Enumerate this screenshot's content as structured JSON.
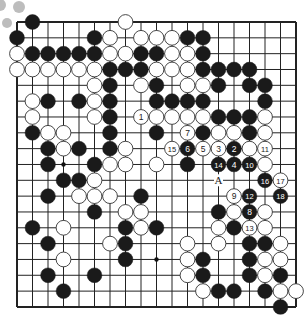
{
  "board": {
    "size": 19,
    "origin_x": 17,
    "origin_y": 22,
    "step_x": 15.5,
    "step_y": 15.83,
    "stone_radius": 7.4,
    "colors": {
      "line": "#222222",
      "black": "#1a1a1a",
      "white": "#ffffff",
      "stone_edge": "#333333",
      "star": "#111111",
      "decor": "#bdbdbd"
    },
    "star_points": [
      [
        3,
        9
      ],
      [
        9,
        15
      ]
    ],
    "label_A": {
      "text": "A",
      "col": 13,
      "row": 10
    },
    "stones": [
      {
        "c": "B",
        "x": 1,
        "y": 0
      },
      {
        "c": "W",
        "x": 7,
        "y": 0
      },
      {
        "c": "B",
        "x": 0,
        "y": 1
      },
      {
        "c": "B",
        "x": 5,
        "y": 1
      },
      {
        "c": "W",
        "x": 6,
        "y": 1
      },
      {
        "c": "W",
        "x": 8,
        "y": 1
      },
      {
        "c": "W",
        "x": 9,
        "y": 1
      },
      {
        "c": "W",
        "x": 10,
        "y": 1
      },
      {
        "c": "B",
        "x": 11,
        "y": 1
      },
      {
        "c": "B",
        "x": 12,
        "y": 1
      },
      {
        "c": "W",
        "x": 0,
        "y": 2
      },
      {
        "c": "B",
        "x": 1,
        "y": 2
      },
      {
        "c": "B",
        "x": 2,
        "y": 2
      },
      {
        "c": "B",
        "x": 3,
        "y": 2
      },
      {
        "c": "B",
        "x": 4,
        "y": 2
      },
      {
        "c": "B",
        "x": 5,
        "y": 2
      },
      {
        "c": "W",
        "x": 6,
        "y": 2
      },
      {
        "c": "W",
        "x": 7,
        "y": 2
      },
      {
        "c": "B",
        "x": 8,
        "y": 2
      },
      {
        "c": "B",
        "x": 9,
        "y": 2
      },
      {
        "c": "W",
        "x": 10,
        "y": 2
      },
      {
        "c": "W",
        "x": 11,
        "y": 2
      },
      {
        "c": "B",
        "x": 12,
        "y": 2
      },
      {
        "c": "W",
        "x": 0,
        "y": 3
      },
      {
        "c": "W",
        "x": 1,
        "y": 3
      },
      {
        "c": "W",
        "x": 2,
        "y": 3
      },
      {
        "c": "W",
        "x": 3,
        "y": 3
      },
      {
        "c": "W",
        "x": 4,
        "y": 3
      },
      {
        "c": "W",
        "x": 5,
        "y": 3
      },
      {
        "c": "B",
        "x": 6,
        "y": 3
      },
      {
        "c": "B",
        "x": 7,
        "y": 3
      },
      {
        "c": "B",
        "x": 8,
        "y": 3
      },
      {
        "c": "W",
        "x": 9,
        "y": 3
      },
      {
        "c": "W",
        "x": 10,
        "y": 3
      },
      {
        "c": "W",
        "x": 11,
        "y": 3
      },
      {
        "c": "B",
        "x": 12,
        "y": 3
      },
      {
        "c": "B",
        "x": 13,
        "y": 3
      },
      {
        "c": "B",
        "x": 14,
        "y": 3
      },
      {
        "c": "B",
        "x": 15,
        "y": 3
      },
      {
        "c": "W",
        "x": 5,
        "y": 4
      },
      {
        "c": "B",
        "x": 6,
        "y": 4
      },
      {
        "c": "W",
        "x": 8,
        "y": 4
      },
      {
        "c": "B",
        "x": 9,
        "y": 4
      },
      {
        "c": "W",
        "x": 11,
        "y": 4
      },
      {
        "c": "W",
        "x": 12,
        "y": 4
      },
      {
        "c": "B",
        "x": 13,
        "y": 4
      },
      {
        "c": "B",
        "x": 15,
        "y": 4
      },
      {
        "c": "B",
        "x": 16,
        "y": 4
      },
      {
        "c": "W",
        "x": 1,
        "y": 5
      },
      {
        "c": "B",
        "x": 2,
        "y": 5
      },
      {
        "c": "B",
        "x": 4,
        "y": 5
      },
      {
        "c": "W",
        "x": 5,
        "y": 5
      },
      {
        "c": "B",
        "x": 6,
        "y": 5
      },
      {
        "c": "B",
        "x": 9,
        "y": 5
      },
      {
        "c": "B",
        "x": 10,
        "y": 5
      },
      {
        "c": "B",
        "x": 11,
        "y": 5
      },
      {
        "c": "B",
        "x": 12,
        "y": 5
      },
      {
        "c": "B",
        "x": 16,
        "y": 5
      },
      {
        "c": "W",
        "x": 1,
        "y": 6
      },
      {
        "c": "W",
        "x": 5,
        "y": 6
      },
      {
        "c": "B",
        "x": 6,
        "y": 6
      },
      {
        "c": "W",
        "x": 8,
        "y": 6,
        "n": "1"
      },
      {
        "c": "W",
        "x": 9,
        "y": 6
      },
      {
        "c": "W",
        "x": 10,
        "y": 6
      },
      {
        "c": "W",
        "x": 11,
        "y": 6
      },
      {
        "c": "W",
        "x": 12,
        "y": 6
      },
      {
        "c": "B",
        "x": 13,
        "y": 6
      },
      {
        "c": "B",
        "x": 14,
        "y": 6
      },
      {
        "c": "B",
        "x": 15,
        "y": 6
      },
      {
        "c": "W",
        "x": 16,
        "y": 6
      },
      {
        "c": "B",
        "x": 1,
        "y": 7
      },
      {
        "c": "W",
        "x": 2,
        "y": 7
      },
      {
        "c": "W",
        "x": 3,
        "y": 7
      },
      {
        "c": "B",
        "x": 6,
        "y": 7
      },
      {
        "c": "B",
        "x": 9,
        "y": 7
      },
      {
        "c": "W",
        "x": 11,
        "y": 7,
        "n": "7"
      },
      {
        "c": "B",
        "x": 12,
        "y": 7
      },
      {
        "c": "W",
        "x": 13,
        "y": 7
      },
      {
        "c": "W",
        "x": 14,
        "y": 7
      },
      {
        "c": "B",
        "x": 15,
        "y": 7
      },
      {
        "c": "W",
        "x": 16,
        "y": 7
      },
      {
        "c": "B",
        "x": 2,
        "y": 8
      },
      {
        "c": "W",
        "x": 3,
        "y": 8
      },
      {
        "c": "B",
        "x": 4,
        "y": 8
      },
      {
        "c": "B",
        "x": 6,
        "y": 8
      },
      {
        "c": "W",
        "x": 7,
        "y": 8
      },
      {
        "c": "W",
        "x": 10,
        "y": 8,
        "n": "15"
      },
      {
        "c": "B",
        "x": 11,
        "y": 8,
        "n": "6"
      },
      {
        "c": "W",
        "x": 12,
        "y": 8,
        "n": "5"
      },
      {
        "c": "W",
        "x": 13,
        "y": 8,
        "n": "3"
      },
      {
        "c": "B",
        "x": 14,
        "y": 8,
        "n": "2"
      },
      {
        "c": "W",
        "x": 15,
        "y": 8
      },
      {
        "c": "W",
        "x": 16,
        "y": 8,
        "n": "11"
      },
      {
        "c": "B",
        "x": 2,
        "y": 9
      },
      {
        "c": "B",
        "x": 5,
        "y": 9
      },
      {
        "c": "W",
        "x": 6,
        "y": 9
      },
      {
        "c": "W",
        "x": 7,
        "y": 9
      },
      {
        "c": "W",
        "x": 9,
        "y": 9
      },
      {
        "c": "B",
        "x": 11,
        "y": 9
      },
      {
        "c": "B",
        "x": 13,
        "y": 9,
        "n": "14"
      },
      {
        "c": "B",
        "x": 14,
        "y": 9,
        "n": "4"
      },
      {
        "c": "B",
        "x": 15,
        "y": 9,
        "n": "10"
      },
      {
        "c": "W",
        "x": 16,
        "y": 9
      },
      {
        "c": "B",
        "x": 3,
        "y": 10
      },
      {
        "c": "B",
        "x": 4,
        "y": 10
      },
      {
        "c": "W",
        "x": 5,
        "y": 10
      },
      {
        "c": "B",
        "x": 16,
        "y": 10,
        "n": "16"
      },
      {
        "c": "W",
        "x": 17,
        "y": 10,
        "n": "17"
      },
      {
        "c": "B",
        "x": 2,
        "y": 11
      },
      {
        "c": "W",
        "x": 4,
        "y": 11
      },
      {
        "c": "W",
        "x": 5,
        "y": 11
      },
      {
        "c": "W",
        "x": 6,
        "y": 11
      },
      {
        "c": "B",
        "x": 8,
        "y": 11
      },
      {
        "c": "W",
        "x": 14,
        "y": 11,
        "n": "9"
      },
      {
        "c": "B",
        "x": 15,
        "y": 11,
        "n": "12"
      },
      {
        "c": "B",
        "x": 17,
        "y": 11,
        "n": "18"
      },
      {
        "c": "B",
        "x": 5,
        "y": 12
      },
      {
        "c": "W",
        "x": 7,
        "y": 12
      },
      {
        "c": "W",
        "x": 8,
        "y": 12
      },
      {
        "c": "B",
        "x": 13,
        "y": 12
      },
      {
        "c": "W",
        "x": 14,
        "y": 12
      },
      {
        "c": "B",
        "x": 15,
        "y": 12,
        "n": "8"
      },
      {
        "c": "W",
        "x": 16,
        "y": 12
      },
      {
        "c": "B",
        "x": 1,
        "y": 13
      },
      {
        "c": "W",
        "x": 3,
        "y": 13
      },
      {
        "c": "B",
        "x": 7,
        "y": 13
      },
      {
        "c": "W",
        "x": 8,
        "y": 13
      },
      {
        "c": "B",
        "x": 9,
        "y": 13
      },
      {
        "c": "W",
        "x": 13,
        "y": 13
      },
      {
        "c": "B",
        "x": 14,
        "y": 13
      },
      {
        "c": "W",
        "x": 15,
        "y": 13,
        "n": "13"
      },
      {
        "c": "W",
        "x": 16,
        "y": 13
      },
      {
        "c": "B",
        "x": 2,
        "y": 14
      },
      {
        "c": "W",
        "x": 6,
        "y": 14
      },
      {
        "c": "B",
        "x": 7,
        "y": 14
      },
      {
        "c": "W",
        "x": 11,
        "y": 14
      },
      {
        "c": "W",
        "x": 13,
        "y": 14
      },
      {
        "c": "B",
        "x": 15,
        "y": 14
      },
      {
        "c": "B",
        "x": 16,
        "y": 14
      },
      {
        "c": "W",
        "x": 17,
        "y": 14
      },
      {
        "c": "W",
        "x": 3,
        "y": 15
      },
      {
        "c": "B",
        "x": 7,
        "y": 15
      },
      {
        "c": "W",
        "x": 11,
        "y": 15
      },
      {
        "c": "B",
        "x": 12,
        "y": 15
      },
      {
        "c": "B",
        "x": 15,
        "y": 15
      },
      {
        "c": "W",
        "x": 16,
        "y": 15
      },
      {
        "c": "W",
        "x": 17,
        "y": 15
      },
      {
        "c": "B",
        "x": 2,
        "y": 16
      },
      {
        "c": "B",
        "x": 5,
        "y": 16
      },
      {
        "c": "W",
        "x": 11,
        "y": 16
      },
      {
        "c": "B",
        "x": 12,
        "y": 16
      },
      {
        "c": "B",
        "x": 15,
        "y": 16
      },
      {
        "c": "W",
        "x": 16,
        "y": 16
      },
      {
        "c": "B",
        "x": 17,
        "y": 16
      },
      {
        "c": "B",
        "x": 3,
        "y": 17
      },
      {
        "c": "W",
        "x": 12,
        "y": 17
      },
      {
        "c": "B",
        "x": 13,
        "y": 17
      },
      {
        "c": "B",
        "x": 14,
        "y": 17
      },
      {
        "c": "B",
        "x": 16,
        "y": 17
      },
      {
        "c": "W",
        "x": 17,
        "y": 17
      },
      {
        "c": "W",
        "x": 18,
        "y": 17
      },
      {
        "c": "B",
        "x": 17,
        "y": 18
      }
    ]
  },
  "decor_circles": [
    {
      "x": 0,
      "y": 5,
      "r": 6
    },
    {
      "x": 19,
      "y": 7,
      "r": 6
    },
    {
      "x": 7,
      "y": 23,
      "r": 5
    }
  ]
}
